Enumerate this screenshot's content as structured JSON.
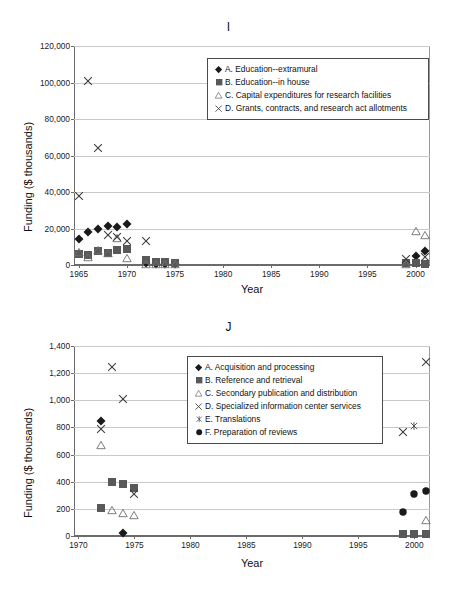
{
  "figure": {
    "panels": [
      "I",
      "J"
    ]
  },
  "chart_data": [
    {
      "id": "I",
      "type": "scatter",
      "title": "I",
      "xlabel": "Year",
      "ylabel": "Funding ($ thousands)",
      "xlim": [
        1964.5,
        2001.5
      ],
      "ylim": [
        0,
        120000
      ],
      "xticks": [
        1965,
        1970,
        1975,
        1980,
        1985,
        1990,
        1995,
        2000
      ],
      "xticklabels": [
        "1965",
        "1970",
        "1975",
        "1980",
        "1985",
        "1990",
        "1995",
        "2000"
      ],
      "yticks": [
        0,
        20000,
        40000,
        60000,
        80000,
        100000,
        120000
      ],
      "yticklabels": [
        "0",
        "20,000",
        "40,000",
        "60,000",
        "80,000",
        "100,000",
        "120,000"
      ],
      "grid": "horizontal",
      "legend_position": "upper-center",
      "series": [
        {
          "name": "A. Education--extramural",
          "marker": "diamond",
          "color": "#1a1a1a",
          "points": [
            [
              1965,
              14000
            ],
            [
              1966,
              17900
            ],
            [
              1967,
              20000
            ],
            [
              1968,
              21400
            ],
            [
              1969,
              21000
            ],
            [
              1970,
              22400
            ],
            [
              1972,
              900
            ],
            [
              1973,
              800
            ],
            [
              1974,
              700
            ],
            [
              1975,
              500
            ],
            [
              1999,
              1100
            ],
            [
              2000,
              5000
            ],
            [
              2001,
              7600
            ]
          ]
        },
        {
          "name": "B. Education--in house",
          "marker": "square",
          "color": "#595959",
          "points": [
            [
              1965,
              5900
            ],
            [
              1966,
              5500
            ],
            [
              1967,
              7400
            ],
            [
              1968,
              6600
            ],
            [
              1969,
              8100
            ],
            [
              1970,
              8800
            ],
            [
              1972,
              2500
            ],
            [
              1973,
              1900
            ],
            [
              1974,
              1800
            ],
            [
              1975,
              900
            ],
            [
              1999,
              1000
            ],
            [
              2000,
              900
            ],
            [
              2001,
              800
            ]
          ]
        },
        {
          "name": "C. Capital expenditures for research facilities",
          "marker": "triangle",
          "color": "#6e6e6e",
          "points": [
            [
              1965,
              7200
            ],
            [
              1966,
              4200
            ],
            [
              1967,
              8000
            ],
            [
              1968,
              6600
            ],
            [
              1969,
              15000
            ],
            [
              1970,
              3600
            ],
            [
              1972,
              300
            ],
            [
              1973,
              300
            ],
            [
              1974,
              300
            ],
            [
              1975,
              300
            ],
            [
              1999,
              700
            ],
            [
              2000,
              18600
            ],
            [
              2001,
              16500
            ]
          ]
        },
        {
          "name": "D. Grants, contracts, and research act allotments",
          "marker": "cross",
          "color": "#3c3c3c",
          "points": [
            [
              1965,
              38000
            ],
            [
              1966,
              101000
            ],
            [
              1967,
              64000
            ],
            [
              1968,
              16600
            ],
            [
              1969,
              15500
            ],
            [
              1970,
              13400
            ],
            [
              1972,
              12900
            ],
            [
              1999,
              3400
            ],
            [
              2001,
              4600
            ]
          ]
        }
      ]
    },
    {
      "id": "J",
      "type": "scatter",
      "title": "J",
      "xlabel": "Year",
      "ylabel": "Funding ($ thousands)",
      "xlim": [
        1969.6,
        2001.4
      ],
      "ylim": [
        0,
        1400
      ],
      "xticks": [
        1970,
        1975,
        1980,
        1985,
        1990,
        1995,
        2000
      ],
      "xticklabels": [
        "1970",
        "1975",
        "1980",
        "1985",
        "1990",
        "1995",
        "2000"
      ],
      "yticks": [
        0,
        200,
        400,
        600,
        800,
        1000,
        1200,
        1400
      ],
      "yticklabels": [
        "0",
        "200",
        "400",
        "600",
        "800",
        "1,000",
        "1,200",
        "1,400"
      ],
      "grid": "horizontal",
      "legend_position": "upper-center",
      "series": [
        {
          "name": "A. Acquisition and processing",
          "marker": "diamond",
          "color": "#1a1a1a",
          "points": [
            [
              1972,
              845
            ],
            [
              1974,
              25
            ]
          ]
        },
        {
          "name": "B. Reference and retrieval",
          "marker": "square",
          "color": "#595959",
          "points": [
            [
              1972,
              205
            ],
            [
              1973,
              395
            ],
            [
              1974,
              382
            ],
            [
              1975,
              352
            ],
            [
              1999,
              12
            ],
            [
              2000,
              12
            ],
            [
              2001,
              12
            ]
          ]
        },
        {
          "name": "C. Secondary publication and distribution",
          "marker": "triangle",
          "color": "#6e6e6e",
          "points": [
            [
              1972,
              670
            ],
            [
              1973,
              192
            ],
            [
              1974,
              172
            ],
            [
              1975,
              157
            ],
            [
              2001,
              118
            ]
          ]
        },
        {
          "name": "D. Specialized information center services",
          "marker": "cross",
          "color": "#3c3c3c",
          "points": [
            [
              1972,
              788
            ],
            [
              1973,
              1248
            ],
            [
              1974,
              1008
            ],
            [
              1975,
              312
            ],
            [
              1999,
              770
            ],
            [
              2001,
              1282
            ]
          ]
        },
        {
          "name": "E. Translations",
          "marker": "star",
          "color": "#3c3c3c",
          "points": [
            [
              2000,
              808
            ]
          ]
        },
        {
          "name": "F. Preparation of reviews",
          "marker": "circle",
          "color": "#1a1a1a",
          "points": [
            [
              1999,
              180
            ],
            [
              2000,
              310
            ],
            [
              2001,
              335
            ]
          ]
        }
      ]
    }
  ]
}
